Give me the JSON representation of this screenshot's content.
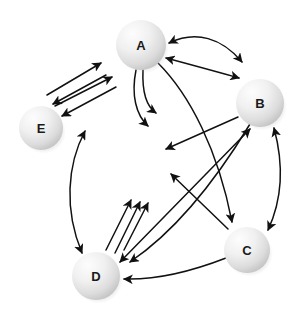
{
  "diagram": {
    "background_color": "#ffffff",
    "edge_color": "#111111",
    "node_fill_light": "#fbfbfb",
    "node_fill_mid": "#eeeeee",
    "node_fill_dark": "#c9c9c9",
    "label_color": "#1a1a1a",
    "nodes": [
      {
        "id": "A",
        "label": "A",
        "cx": 141,
        "cy": 45,
        "r": 25
      },
      {
        "id": "B",
        "label": "B",
        "cx": 260,
        "cy": 103,
        "r": 24
      },
      {
        "id": "C",
        "label": "C",
        "cx": 247,
        "cy": 250,
        "r": 23
      },
      {
        "id": "D",
        "label": "D",
        "cx": 96,
        "cy": 276,
        "r": 24
      },
      {
        "id": "E",
        "label": "E",
        "cx": 41,
        "cy": 128,
        "r": 22
      }
    ],
    "edges": [
      {
        "id": "e1",
        "from": "E",
        "to": "A",
        "kind": "straight",
        "arrow": "end",
        "d": "M 47 95 L 101 63"
      },
      {
        "id": "e2",
        "from": "A",
        "to": "E",
        "kind": "straight",
        "arrow": "end",
        "d": "M 106 75 L 53 104"
      },
      {
        "id": "e3",
        "from": "E",
        "to": "A",
        "kind": "straight",
        "arrow": "end",
        "d": "M 55 106 L 112 77"
      },
      {
        "id": "e4",
        "from": "A",
        "to": "E",
        "kind": "straight",
        "arrow": "end",
        "d": "M 116 87 L 62 116"
      },
      {
        "id": "e5",
        "from": "A",
        "to": "B",
        "kind": "curve",
        "arrow": "both",
        "d": "M 169 43 C 196 30 222 38 242 62"
      },
      {
        "id": "e6",
        "from": "B",
        "to": "A",
        "kind": "curve",
        "arrow": "both",
        "d": "M 166 58 C 192 65 218 72 239 78"
      },
      {
        "id": "e7",
        "from": "A",
        "to": "A",
        "kind": "curve",
        "arrow": "end",
        "d": "M 136 70 C 131 95 136 115 148 126"
      },
      {
        "id": "e8",
        "from": "A",
        "to": "A",
        "kind": "curve",
        "arrow": "end",
        "d": "M 143 70 C 142 92 146 106 156 113"
      },
      {
        "id": "e9",
        "from": "A",
        "to": "C",
        "kind": "curve",
        "arrow": "end",
        "d": "M 158 63 C 190 95 218 150 232 222"
      },
      {
        "id": "e10",
        "from": "B",
        "to": "Center",
        "kind": "straight",
        "arrow": "end",
        "d": "M 238 117 L 166 149"
      },
      {
        "id": "e11",
        "from": "D",
        "to": "E",
        "kind": "curve",
        "arrow": "both",
        "d": "M 82 253 C 64 210 67 165 85 131"
      },
      {
        "id": "e12",
        "from": "D",
        "to": "B",
        "kind": "straight",
        "arrow": "end",
        "d": "M 106 250 L 131 200"
      },
      {
        "id": "e13",
        "from": "D",
        "to": "B",
        "kind": "straight",
        "arrow": "end",
        "d": "M 115 253 L 140 202"
      },
      {
        "id": "e14",
        "from": "D",
        "to": "B",
        "kind": "straight",
        "arrow": "end",
        "d": "M 124 250 L 148 203"
      },
      {
        "id": "e15",
        "from": "C",
        "to": "Center",
        "kind": "straight",
        "arrow": "end",
        "d": "M 228 229 L 171 174"
      },
      {
        "id": "e16",
        "from": "B",
        "to": "C",
        "kind": "curve",
        "arrow": "both",
        "d": "M 274 128 C 284 165 282 200 268 230"
      },
      {
        "id": "e17",
        "from": "D",
        "to": "B",
        "kind": "straight",
        "arrow": "both",
        "d": "M 120 262 L 250 129"
      },
      {
        "id": "e18",
        "from": "C",
        "to": "D",
        "kind": "curve",
        "arrow": "end",
        "d": "M 226 258 C 190 272 155 280 124 279"
      },
      {
        "id": "e19",
        "from": "B",
        "to": "D",
        "kind": "curve",
        "arrow": "end",
        "d": "M 250 124 C 210 190 170 235 130 262"
      }
    ]
  }
}
